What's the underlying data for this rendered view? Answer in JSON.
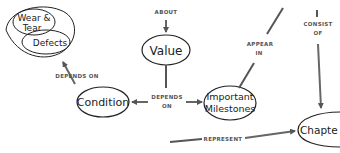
{
  "diagram": {
    "type": "concept-map",
    "nodes": {
      "wear_tear": "Wear &",
      "wear_tear_2": "Tear",
      "defects": "Defects",
      "value": "Value",
      "condition": "Condition",
      "milestones_1": "Important",
      "milestones_2": "Milestones",
      "chapter": "Chapte"
    },
    "links": {
      "about": "ABOUT",
      "depends_on_top": "DEPENDS ON",
      "depends_on_mid_1": "DEPENDS",
      "depends_on_mid_2": "ON",
      "appear_1": "APPEAR",
      "appear_2": "IN",
      "consist_1": "CONSIST",
      "consist_2": "OF",
      "represent": "REPRESENT"
    },
    "colors": {
      "stroke": "#222222",
      "arrow": "#666666",
      "label": "#555555"
    }
  }
}
